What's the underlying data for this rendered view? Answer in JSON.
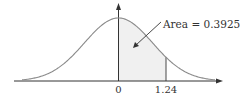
{
  "diagram": {
    "type": "normal-distribution-shaded-area",
    "annotation": "Area = 0.3925",
    "x_ticks": [
      {
        "label": "0",
        "z": 0
      },
      {
        "label": "1.24",
        "z": 1.24
      }
    ],
    "shaded_region": {
      "from_z": 0,
      "to_z": 1.24,
      "area": 0.3925
    },
    "colors": {
      "curve": "#8a8a8a",
      "axis": "#333333",
      "shade": "#f0f0f0",
      "text": "#333333"
    }
  },
  "chart_data": {
    "type": "area",
    "title": "",
    "xlabel": "",
    "ylabel": "",
    "distribution": "standard normal",
    "x_tick_labels": [
      "0",
      "1.24"
    ],
    "shaded_interval": [
      0,
      1.24
    ],
    "annotations": [
      "Area = 0.3925"
    ]
  }
}
